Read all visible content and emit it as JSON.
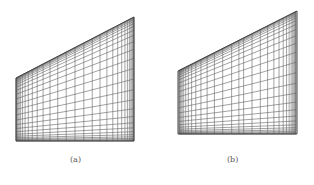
{
  "figure": {
    "panels": [
      {
        "id": "a",
        "caption": "(a)",
        "description": "Structured quadrilateral mesh on trapezoidal domain with boundary-layer clustering along all edges",
        "shape": {
          "left": 16,
          "right": 134,
          "top_left_y": 78,
          "top_right_y": 17,
          "bottom_y": 141
        },
        "grid": {
          "nx": 30,
          "ny": 26,
          "cluster": 2.2,
          "interior_refinement": false
        }
      },
      {
        "id": "b",
        "caption": "(b)",
        "description": "Structured quadrilateral mesh on trapezoidal domain with boundary-layer clustering and additional refinement along a vertical interior line",
        "shape": {
          "left": 178,
          "right": 297,
          "top_left_y": 71,
          "top_right_y": 11,
          "bottom_y": 134
        },
        "grid": {
          "nx": 30,
          "ny": 26,
          "cluster": 2.2,
          "interior_refinement": true,
          "refine_at": 0.52
        }
      }
    ],
    "line_color": "#555555"
  }
}
